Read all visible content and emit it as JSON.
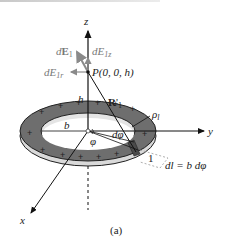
{
  "figure": {
    "caption": "(a)",
    "axes": {
      "z": "z",
      "y": "y",
      "x": "x"
    },
    "point": {
      "label": "P(0, 0, h)"
    },
    "vectors": {
      "dE1": {
        "prefix": "d",
        "main": "E",
        "sub": "1"
      },
      "dE1z": {
        "prefix": "dE",
        "sub": "1z"
      },
      "dE1r": {
        "prefix": "dE",
        "sub": "1r"
      },
      "R1": {
        "main": "R",
        "prime": "'",
        "sub": "1"
      }
    },
    "height_label": "h",
    "radius_label": "b",
    "charge_density": {
      "main": "ρ",
      "sub": "l"
    },
    "angle_label": "φ",
    "dphi_label": "dφ",
    "segment_label": "1",
    "dl_equation": "dl = b dφ",
    "charge_sign": "+",
    "colors": {
      "ring_fill": "#6e6e6e",
      "ring_edge": "#d9d9d9",
      "inner_side": "#e4e4e4",
      "vector_gray": "#8a8a8a",
      "dashed": "#999999"
    }
  }
}
